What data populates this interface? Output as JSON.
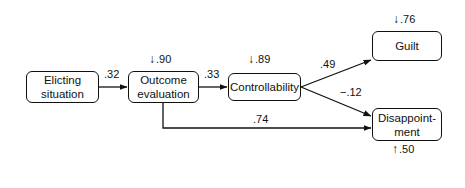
{
  "nodes": {
    "eliciting": "Elicting\nsituation",
    "eliciting_l1": "Elicting",
    "eliciting_l2": "situation",
    "outcome_l1": "Outcome",
    "outcome_l2": "evaluation",
    "controllability": "Controllability",
    "guilt": "Guilt",
    "disappointment_l1": "Disappoint-",
    "disappointment_l2": "ment"
  },
  "paths": {
    "eliciting_to_outcome": ".32",
    "outcome_to_controllability": ".33",
    "controllability_to_guilt": ".49",
    "controllability_to_disappointment": "−.12",
    "outcome_to_disappointment": ".74"
  },
  "residuals": {
    "outcome": ".90",
    "controllability": ".89",
    "guilt": ".76",
    "disappointment": ".50"
  },
  "icons": {
    "down_arrow": "↓",
    "up_arrow": "↑"
  }
}
